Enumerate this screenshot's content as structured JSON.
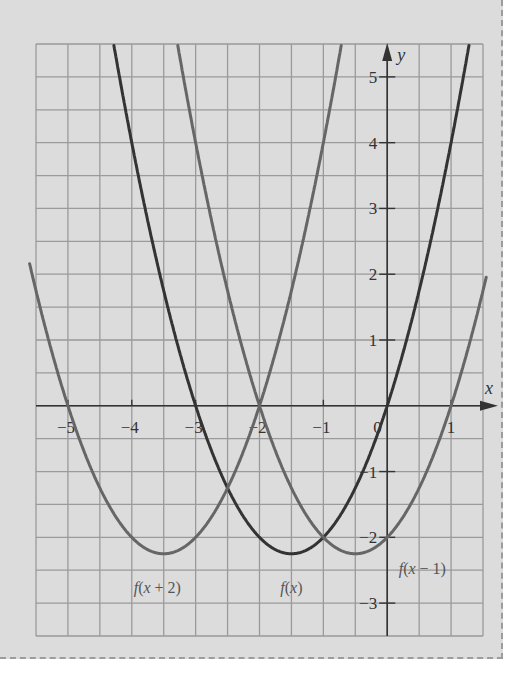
{
  "chart_data": {
    "type": "line",
    "title": "",
    "xlabel": "x",
    "ylabel": "y",
    "xlim": [
      -5.5,
      1.5
    ],
    "ylim": [
      -3.5,
      5.5
    ],
    "grid": true,
    "grid_step": 0.5,
    "x_ticks": [
      -5,
      -4,
      -3,
      -2,
      -1,
      0,
      1
    ],
    "x_tick_labels": [
      "−5",
      "−4",
      "−3",
      "−2",
      "−1",
      "0",
      "1"
    ],
    "y_ticks": [
      5,
      4,
      3,
      2,
      1,
      -1,
      -2,
      -3
    ],
    "y_tick_labels": [
      "5",
      "4",
      "3",
      "2",
      "1",
      "−1",
      "−2",
      "−3"
    ],
    "series": [
      {
        "name": "f(x)",
        "formula": "x^2 + 3x",
        "vertex": [
          -1.5,
          -2.25
        ],
        "roots": [
          -3,
          0
        ],
        "color": "#333333",
        "label_pos": [
          -1.5,
          -2.85
        ]
      },
      {
        "name": "f(x + 2)",
        "formula": "(x+2)^2 + 3(x+2)",
        "vertex": [
          -3.5,
          -2.25
        ],
        "roots": [
          -5,
          -2
        ],
        "color": "#666666",
        "label_pos": [
          -3.6,
          -2.85
        ]
      },
      {
        "name": "f(x − 1)",
        "formula": "(x-1)^2 + 3(x-1)",
        "vertex": [
          -0.5,
          -2.25
        ],
        "roots": [
          -2,
          1
        ],
        "color": "#666666",
        "label_pos": [
          0.55,
          -2.55
        ]
      }
    ]
  },
  "colors": {
    "background": "#dcdcdc",
    "grid": "#9a9a9a",
    "axis": "#333333",
    "border": "#9c9c9c"
  }
}
